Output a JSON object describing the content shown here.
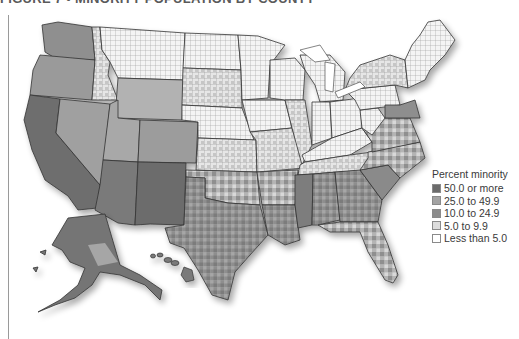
{
  "figure": {
    "title": "FIGURE 7 • MINORITY POPULATION BY COUNTY"
  },
  "legend": {
    "title": "Percent minority",
    "items": [
      {
        "label": "50.0 or more",
        "color": "#6b6b6b"
      },
      {
        "label": "25.0 to 49.9",
        "color": "#a3a3a3"
      },
      {
        "label": "10.0 to 24.9",
        "color": "#8c8c8c"
      },
      {
        "label": "5.0 to 9.9",
        "color": "#dcdcdc"
      },
      {
        "label": "Less than 5.0",
        "color": "#ffffff"
      }
    ]
  },
  "map": {
    "subject": "United States counties, percent minority population",
    "insets": [
      "Alaska",
      "Hawaii"
    ]
  }
}
